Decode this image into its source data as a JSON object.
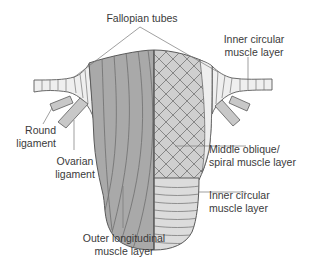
{
  "diagram": {
    "labels": {
      "fallopian_tubes": "Fallopian tubes",
      "inner_circular_top": [
        "Inner circular",
        "muscle layer"
      ],
      "round_ligament": [
        "Round",
        "ligament"
      ],
      "ovarian_ligament": [
        "Ovarian",
        "ligament"
      ],
      "middle_oblique": [
        "Middle oblique/",
        "spiral muscle layer"
      ],
      "inner_circular_bottom": [
        "Inner circular",
        "muscle layer"
      ],
      "outer_longitudinal": [
        "Outer longitudinal",
        "muscle layer"
      ]
    },
    "colors": {
      "outer_layer_fill": "#a9a9a9",
      "middle_layer_fill": "#cfcfcf",
      "inner_layer_fill": "#dcdcdc",
      "tube_fill": "#efefef",
      "outline": "#5a5a5a",
      "leader_line": "#777777",
      "text": "#3a3a3a"
    }
  }
}
